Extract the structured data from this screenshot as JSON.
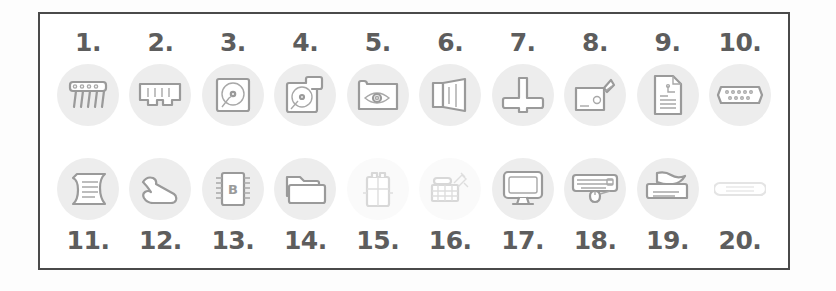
{
  "sheet": {
    "title": "Computer hardware component icons worksheet",
    "border_color": "#4a4a4a",
    "background_color": "#ffffff",
    "icon_disc_color": "#ededed",
    "ink_color": "#9a9a9a",
    "number_color": "#5d5d5d",
    "rows": 2,
    "columns": 10
  },
  "items": [
    {
      "number": "1.",
      "icon": "resistor-network-icon",
      "row": 1,
      "col": 1
    },
    {
      "number": "2.",
      "icon": "ram-module-icon",
      "row": 1,
      "col": 2
    },
    {
      "number": "3.",
      "icon": "hard-disk-icon",
      "row": 1,
      "col": 3
    },
    {
      "number": "4.",
      "icon": "floppy-drive-icon",
      "row": 1,
      "col": 4
    },
    {
      "number": "5.",
      "icon": "webcam-eye-icon",
      "row": 1,
      "col": 5
    },
    {
      "number": "6.",
      "icon": "speaker-icon",
      "row": 1,
      "col": 6
    },
    {
      "number": "7.",
      "icon": "cpu-cooler-icon",
      "row": 1,
      "col": 7
    },
    {
      "number": "8.",
      "icon": "power-supply-icon",
      "row": 1,
      "col": 8
    },
    {
      "number": "9.",
      "icon": "document-page-icon",
      "row": 1,
      "col": 9
    },
    {
      "number": "10.",
      "icon": "serial-port-icon",
      "row": 1,
      "col": 10
    },
    {
      "number": "11.",
      "icon": "scroll-document-icon",
      "row": 2,
      "col": 1
    },
    {
      "number": "12.",
      "icon": "wrench-tool-icon",
      "row": 2,
      "col": 2
    },
    {
      "number": "13.",
      "icon": "bios-chip-icon",
      "row": 2,
      "col": 3
    },
    {
      "number": "14.",
      "icon": "folder-icon",
      "row": 2,
      "col": 4
    },
    {
      "number": "15.",
      "icon": "battery-cell-icon",
      "row": 2,
      "col": 5
    },
    {
      "number": "16.",
      "icon": "expansion-card-icon",
      "row": 2,
      "col": 6
    },
    {
      "number": "17.",
      "icon": "monitor-icon",
      "row": 2,
      "col": 7
    },
    {
      "number": "18.",
      "icon": "keyboard-mouse-icon",
      "row": 2,
      "col": 8
    },
    {
      "number": "19.",
      "icon": "printer-icon",
      "row": 2,
      "col": 9
    },
    {
      "number": "20.",
      "icon": "cable-connector-icon",
      "row": 2,
      "col": 10
    }
  ]
}
